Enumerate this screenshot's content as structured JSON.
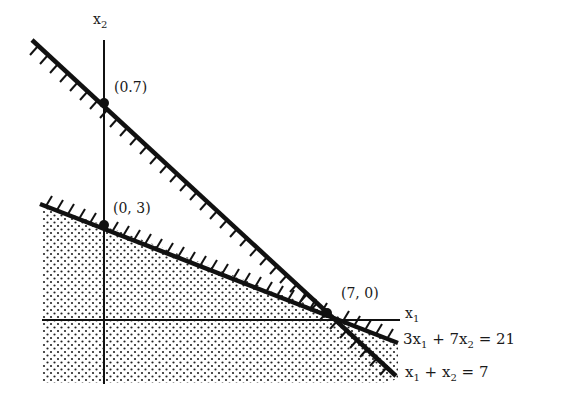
{
  "diagram": {
    "type": "linear-programming-feasible-region",
    "axes": {
      "x_label": "x",
      "x_sub": "1",
      "y_label": "x",
      "y_sub": "2"
    },
    "points": [
      {
        "label": "(0.7)",
        "meaning": "intercept of x1 + x2 = 7 on x2 axis"
      },
      {
        "label": "(0, 3)",
        "meaning": "intercept of 3x1 + 7x2 = 21 on x2 axis"
      },
      {
        "label": "(7, 0)",
        "meaning": "common intercept on x1 axis"
      }
    ],
    "constraints": [
      {
        "id": "c1",
        "parts": [
          "3x",
          "1",
          " + 7x",
          "2",
          " = 21"
        ],
        "text": "3x1 + 7x2 = 21"
      },
      {
        "id": "c2",
        "parts": [
          "x",
          "1",
          " + x",
          "2",
          " = 7"
        ],
        "text": "x1 + x2 = 7"
      }
    ],
    "colors": {
      "ink": "#111111",
      "background": "#ffffff"
    }
  }
}
